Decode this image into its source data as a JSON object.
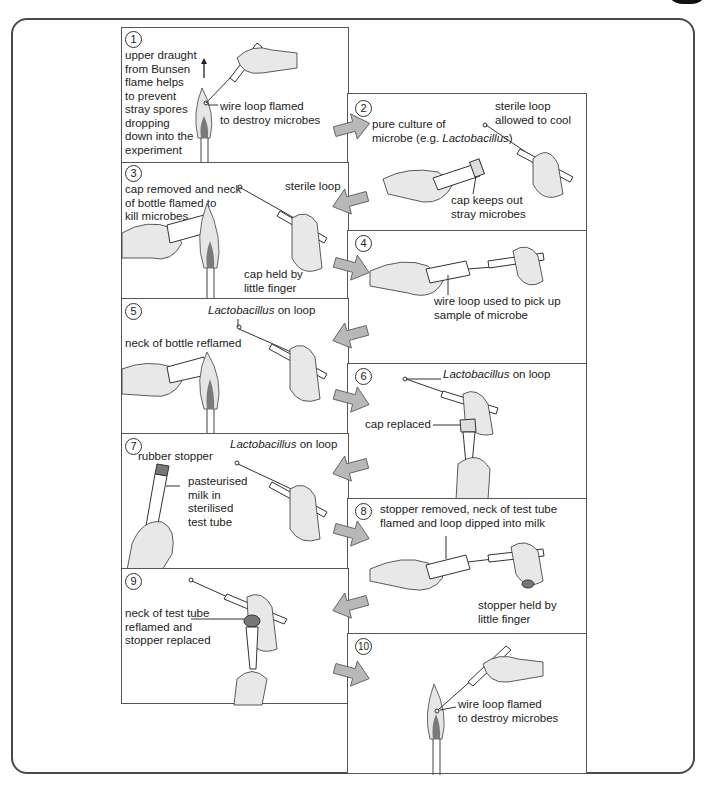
{
  "figure": {
    "steps": [
      {
        "n": "1",
        "labels": [
          "upper draught",
          "from Bunsen",
          "flame helps",
          "to prevent",
          "stray spores",
          "dropping",
          "down into the",
          "experiment"
        ],
        "callout": [
          "wire loop flamed",
          "to destroy microbes"
        ]
      },
      {
        "n": "2",
        "culture_a": "pure culture of",
        "culture_b": "microbe (e.g. ",
        "culture_italic": "Lactobacillus",
        "culture_c": ")",
        "loop": [
          "sterile loop",
          "allowed to cool"
        ],
        "cap": [
          "cap keeps out",
          "stray microbes"
        ]
      },
      {
        "n": "3",
        "neck": [
          "cap removed and neck",
          "of bottle flamed to",
          "kill microbes"
        ],
        "loop": "sterile loop",
        "cap": [
          "cap held by",
          "little finger"
        ]
      },
      {
        "n": "4",
        "callout": [
          "wire loop  used to pick up",
          "sample of microbe"
        ]
      },
      {
        "n": "5",
        "loop_italic": "Lactobacillus",
        "loop_rest": " on loop",
        "neck": "neck of bottle reflamed"
      },
      {
        "n": "6",
        "loop_italic": "Lactobacillus",
        "loop_rest": " on loop",
        "cap": "cap replaced"
      },
      {
        "n": "7",
        "loop_italic": "Lactobacillus",
        "loop_rest": " on loop",
        "stopper": "rubber stopper",
        "milk": [
          "pasteurised",
          "milk in",
          "sterilised",
          "test tube"
        ]
      },
      {
        "n": "8",
        "top": [
          "stopper removed, neck of test tube",
          "flamed and loop dipped into milk"
        ],
        "stopper": [
          "stopper held by",
          "little finger"
        ]
      },
      {
        "n": "9",
        "neck": [
          "neck of test tube",
          "reflamed and",
          "stopper replaced"
        ]
      },
      {
        "n": "10",
        "callout": [
          "wire loop flamed",
          "to destroy microbes"
        ]
      }
    ]
  },
  "colors": {
    "arrow": "#b8b8b8",
    "flame_inner": "#7a7a7a",
    "flame_outer": "#e6e6e6",
    "hand": "#e8e8e8",
    "border": "#4a4a4a"
  }
}
